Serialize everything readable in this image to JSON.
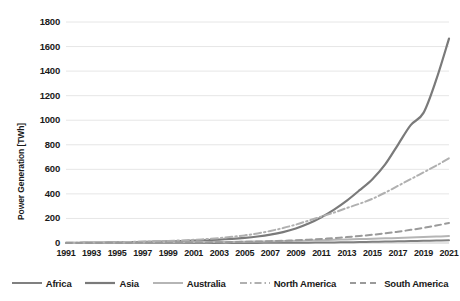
{
  "chart_data": {
    "type": "line",
    "title": "",
    "xlabel": "",
    "ylabel": "Power Generation [TWh]",
    "xlim": [
      1991,
      2021
    ],
    "ylim": [
      0,
      1800
    ],
    "grid": "horizontal",
    "legend_position": "bottom",
    "x": [
      1991,
      1992,
      1993,
      1994,
      1995,
      1996,
      1997,
      1998,
      1999,
      2000,
      2001,
      2002,
      2003,
      2004,
      2005,
      2006,
      2007,
      2008,
      2009,
      2010,
      2011,
      2012,
      2013,
      2014,
      2015,
      2016,
      2017,
      2018,
      2019,
      2020,
      2021
    ],
    "xticks": [
      "1991",
      "1993",
      "1995",
      "1997",
      "1999",
      "2001",
      "2003",
      "2005",
      "2007",
      "2009",
      "2011",
      "2013",
      "2015",
      "2017",
      "2019",
      "2021"
    ],
    "yticks": [
      "0",
      "200",
      "400",
      "600",
      "800",
      "1000",
      "1200",
      "1400",
      "1600",
      "1800"
    ],
    "series": [
      {
        "name": "Africa",
        "style": "solid",
        "color": "#808080",
        "width": 2,
        "values": [
          0,
          0,
          0,
          0,
          0,
          0,
          0,
          0,
          0,
          0,
          0,
          0,
          1,
          1,
          1,
          1,
          2,
          2,
          3,
          3,
          4,
          5,
          6,
          8,
          10,
          12,
          14,
          16,
          18,
          20,
          22
        ]
      },
      {
        "name": "Asia",
        "style": "solid",
        "color": "#7a7a7a",
        "width": 2.2,
        "values": [
          1,
          2,
          3,
          4,
          5,
          7,
          9,
          11,
          13,
          16,
          19,
          23,
          28,
          34,
          42,
          53,
          68,
          89,
          118,
          158,
          210,
          272,
          345,
          430,
          520,
          640,
          800,
          960,
          1060,
          1330,
          1665
        ]
      },
      {
        "name": "Australia",
        "style": "solid",
        "color": "#b5b5b5",
        "width": 2,
        "values": [
          1,
          1,
          2,
          2,
          2,
          3,
          3,
          4,
          4,
          5,
          6,
          7,
          8,
          9,
          11,
          12,
          14,
          16,
          18,
          20,
          23,
          26,
          29,
          32,
          35,
          38,
          41,
          44,
          48,
          52,
          56
        ]
      },
      {
        "name": "North America",
        "style": "dashdot",
        "color": "#b0b0b0",
        "width": 2,
        "values": [
          2,
          3,
          4,
          5,
          7,
          9,
          11,
          14,
          17,
          21,
          26,
          32,
          40,
          50,
          62,
          78,
          98,
          122,
          150,
          182,
          215,
          248,
          285,
          320,
          360,
          410,
          465,
          520,
          575,
          630,
          690
        ]
      },
      {
        "name": "South America",
        "style": "dashed",
        "color": "#9a9a9a",
        "width": 2,
        "values": [
          0,
          0,
          0,
          1,
          1,
          1,
          2,
          2,
          3,
          3,
          4,
          5,
          6,
          8,
          10,
          12,
          15,
          18,
          22,
          27,
          33,
          40,
          48,
          57,
          67,
          79,
          92,
          107,
          123,
          142,
          163
        ]
      }
    ]
  },
  "axes": {
    "ylabel": "Power Generation [TWh]"
  }
}
